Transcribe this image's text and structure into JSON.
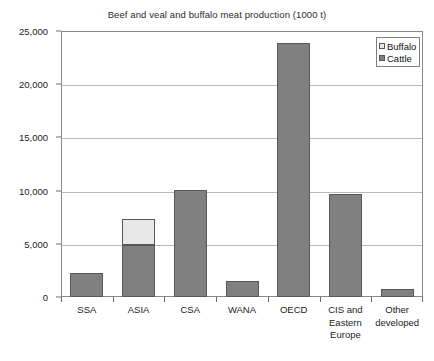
{
  "chart_data": {
    "type": "bar",
    "subtype": "stacked-vertical-bar",
    "title": "Beef and veal and buffalo meat production (1000 t)",
    "xlabel": "",
    "ylabel": "",
    "ylim": [
      0,
      25000
    ],
    "ytick_values": [
      0,
      5000,
      10000,
      15000,
      20000,
      25000
    ],
    "ytick_labels": [
      "0",
      "5,000",
      "10,000",
      "15,000",
      "20,000",
      "25,000"
    ],
    "grid": true,
    "grid_axis": "y",
    "legend_position": "top-right-inside",
    "categories": [
      "SSA",
      "ASIA",
      "CSA",
      "WANA",
      "OECD",
      "CIS and Eastern Europe",
      "Other developed"
    ],
    "category_label_lines": [
      [
        "SSA"
      ],
      [
        "ASIA"
      ],
      [
        "CSA"
      ],
      [
        "WANA"
      ],
      [
        "OECD"
      ],
      [
        "CIS and",
        "Eastern",
        "Europe"
      ],
      [
        "Other",
        "developed"
      ]
    ],
    "series": [
      {
        "name": "Cattle",
        "color": "#808080",
        "values": [
          2250,
          4900,
          10100,
          1500,
          23900,
          9700,
          800
        ]
      },
      {
        "name": "Buffalo",
        "color": "#e8e8e8",
        "values": [
          0,
          2400,
          0,
          0,
          0,
          0,
          0
        ]
      }
    ],
    "stack_order_bottom_to_top": [
      "Cattle",
      "Buffalo"
    ],
    "totals": [
      2250,
      7300,
      10100,
      1500,
      23900,
      9700,
      800
    ]
  },
  "legend": {
    "items": [
      {
        "label": "Buffalo",
        "color": "#e8e8e8"
      },
      {
        "label": "Cattle",
        "color": "#808080"
      }
    ]
  }
}
